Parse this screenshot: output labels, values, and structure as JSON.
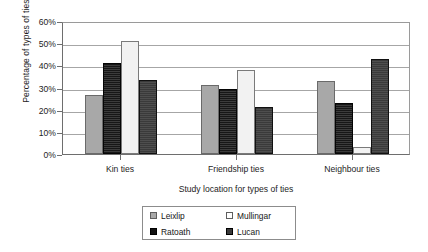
{
  "chart_data": {
    "type": "bar",
    "title": "",
    "xlabel": "Study location for types of ties",
    "ylabel": "Percentage of types of ties",
    "categories": [
      "Kin ties",
      "Friendship ties",
      "Neighbour ties"
    ],
    "series": [
      {
        "name": "Leixlip",
        "color": "#a8a8a8",
        "values": [
          26.5,
          31.0,
          33.0
        ]
      },
      {
        "name": "Ratoath",
        "color": "#171717",
        "values": [
          41.0,
          29.5,
          23.0
        ]
      },
      {
        "name": "Mullingar",
        "color": "#f2f2f2",
        "values": [
          51.0,
          38.0,
          3.0
        ]
      },
      {
        "name": "Lucan",
        "color": "#3a3a3a",
        "values": [
          33.5,
          21.0,
          43.0
        ]
      }
    ],
    "series_plot_order": [
      "Leixlip",
      "Ratoath",
      "Mullingar",
      "Lucan"
    ],
    "ylim": [
      0,
      60
    ],
    "yticks": [
      0,
      10,
      20,
      30,
      40,
      50,
      60
    ],
    "ytick_labels": [
      "0%",
      "10%",
      "20%",
      "30%",
      "40%",
      "50%",
      "60%"
    ],
    "grid": true,
    "legend_position": "bottom-center",
    "legend_order": [
      "Leixlip",
      "Mullingar",
      "Ratoath",
      "Lucan"
    ]
  },
  "axis": {
    "ylabel": "Percentage of types of ties",
    "xlabel": "Study location for types of ties"
  },
  "legend": {
    "entries": [
      {
        "label": "Leixlip",
        "swatch": "leixlip-swatch"
      },
      {
        "label": "Mullingar",
        "swatch": "mullingar-swatch"
      },
      {
        "label": "Ratoath",
        "swatch": "ratoath-swatch"
      },
      {
        "label": "Lucan",
        "swatch": "lucan-swatch"
      }
    ]
  }
}
